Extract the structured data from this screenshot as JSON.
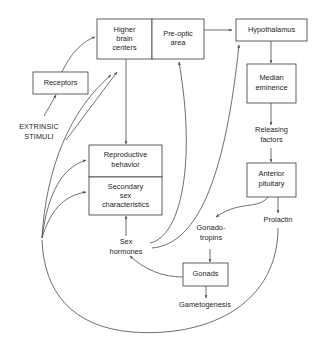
{
  "diagram": {
    "background_color": "#ffffff",
    "line_color": "#4a4a4a",
    "box_stroke_color": "#3a3a3a",
    "text_color": "#1c1c1c"
  },
  "nodes": {
    "higher_brain_centers": {
      "label_line1": "Higher",
      "label_line2": "brain",
      "label_line3": "centers"
    },
    "pre_optic_area": {
      "label_line1": "Pre-optic",
      "label_line2": "area"
    },
    "hypothalamus": {
      "label": "Hypothalamus"
    },
    "median_eminence": {
      "label_line1": "Median",
      "label_line2": "eminence"
    },
    "anterior_pituitary": {
      "label_line1": "Anterior",
      "label_line2": "pituitary"
    },
    "receptors": {
      "label": "Receptors"
    },
    "reproductive_behavior": {
      "label_line1": "Reproductive",
      "label_line2": "behavior"
    },
    "secondary_sex_characteristics": {
      "label_line1": "Secondary",
      "label_line2": "sex",
      "label_line3": "characteristics"
    },
    "gonads": {
      "label": "Gonads"
    }
  },
  "free_labels": {
    "extrinsic_stimuli": {
      "line1": "EXTRINSIC",
      "line2": "STIMULI"
    },
    "releasing_factors": {
      "line1": "Releasing",
      "line2": "factors"
    },
    "sex_hormones": {
      "line1": "Sex",
      "line2": "hormones"
    },
    "gonadotropins": {
      "line1": "Gonado-",
      "line2": "tropins"
    },
    "prolactin": {
      "line1": "Prolactin"
    },
    "gametogenesis": {
      "line1": "Gametogenesis"
    }
  }
}
